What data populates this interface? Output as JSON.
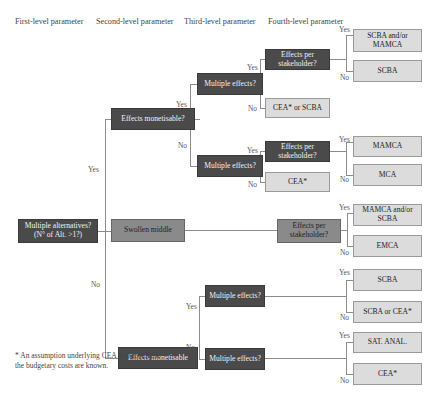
{
  "headers": {
    "first": "First-level parameter",
    "second": "Second-level parameter",
    "third": "Third-level parameter",
    "fourth": "Fourth-level parameter"
  },
  "nodes": {
    "root": "Multiple alternatives? (N° of Alt. >1?)",
    "effects_monetisable_q": "Effects monetisable?",
    "swollen_middle": "Swollen middle",
    "effects_monetisable_bottom": "Effects monetisable",
    "multiple_effects_1": "Multiple effects?",
    "multiple_effects_2": "Multiple effects?",
    "multiple_effects_3": "Multiple effects?",
    "multiple_effects_4": "Multiple effects?",
    "effects_per_stakeholder_1": "Effects per stakeholder?",
    "effects_per_stakeholder_2": "Effects per stakeholder?",
    "effects_per_stakeholder_3": "Effects per stakeholder?",
    "cea_or_scba": "CEA* or SCBA",
    "cea_1": "CEA*"
  },
  "outcomes": [
    "SCBA and/or MAMCA",
    "SCBA",
    "MAMCA",
    "MCA",
    "MAMCA and/or SCBA",
    "EMCA",
    "SCBA",
    "SCBA or CEA*",
    "SAT. ANAL.",
    "CEA*"
  ],
  "labels": {
    "yes": "Yes",
    "no": "No"
  },
  "footnote": "* An assumption underlying CEA is that at least the budgetary costs are known.",
  "colors": {
    "dark": "#4a4a4a",
    "mid": "#8a8a8a",
    "light": "#dcdcdc",
    "line": "#8c8c8c"
  }
}
